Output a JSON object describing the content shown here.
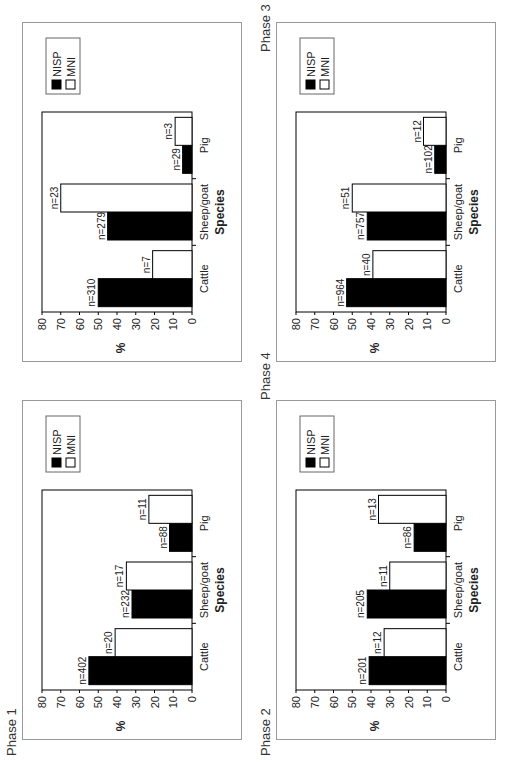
{
  "chart_data": [
    {
      "type": "bar",
      "title": "Phase 1",
      "xlabel": "Species",
      "ylabel": "%",
      "ylim": [
        0,
        80
      ],
      "yticks": [
        0,
        10,
        20,
        30,
        40,
        50,
        60,
        70,
        80
      ],
      "categories": [
        "Cattle",
        "Sheep/goat",
        "Pig"
      ],
      "legend": [
        "NISP",
        "MNI"
      ],
      "legend_position": "right",
      "grid": false,
      "series": [
        {
          "name": "NISP",
          "color": "#000000",
          "values": [
            55,
            32,
            12
          ],
          "labels": [
            "n=402",
            "n=232",
            "n=88"
          ]
        },
        {
          "name": "MNI",
          "color": "#ffffff",
          "values": [
            41,
            35,
            23
          ],
          "labels": [
            "n=20",
            "n=17",
            "n=11"
          ]
        }
      ]
    },
    {
      "type": "bar",
      "title": "Phase 2",
      "xlabel": "Species",
      "ylabel": "%",
      "ylim": [
        0,
        80
      ],
      "yticks": [
        0,
        10,
        20,
        30,
        40,
        50,
        60,
        70,
        80
      ],
      "categories": [
        "Cattle",
        "Sheep/goat",
        "Pig"
      ],
      "legend": [
        "NISP",
        "MNI"
      ],
      "legend_position": "right",
      "grid": false,
      "series": [
        {
          "name": "NISP",
          "color": "#000000",
          "values": [
            41,
            42,
            17
          ],
          "labels": [
            "n=201",
            "n=205",
            "n=86"
          ]
        },
        {
          "name": "MNI",
          "color": "#ffffff",
          "values": [
            33,
            30,
            36
          ],
          "labels": [
            "n=12",
            "n=11",
            "n=13"
          ]
        }
      ]
    },
    {
      "type": "bar",
      "title": "Phase 3",
      "xlabel": "Species",
      "ylabel": "%",
      "ylim": [
        0,
        80
      ],
      "yticks": [
        0,
        10,
        20,
        30,
        40,
        50,
        60,
        70,
        80
      ],
      "categories": [
        "Cattle",
        "Sheep/goat",
        "Pig"
      ],
      "legend": [
        "NISP",
        "MNI"
      ],
      "legend_position": "right",
      "grid": false,
      "series": [
        {
          "name": "NISP",
          "color": "#000000",
          "values": [
            53,
            42,
            6
          ],
          "labels": [
            "n=964",
            "n=757",
            "n=102"
          ]
        },
        {
          "name": "MNI",
          "color": "#ffffff",
          "values": [
            39,
            50,
            12
          ],
          "labels": [
            "n=40",
            "n=51",
            "n=12"
          ]
        }
      ]
    },
    {
      "type": "bar",
      "title": "Phase 4",
      "xlabel": "Species",
      "ylabel": "%",
      "ylim": [
        0,
        80
      ],
      "yticks": [
        0,
        10,
        20,
        30,
        40,
        50,
        60,
        70,
        80
      ],
      "categories": [
        "Cattle",
        "Sheep/goat",
        "Pig"
      ],
      "legend": [
        "NISP",
        "MNI"
      ],
      "legend_position": "right",
      "grid": false,
      "series": [
        {
          "name": "NISP",
          "color": "#000000",
          "values": [
            50,
            45,
            5
          ],
          "labels": [
            "n=310",
            "n=279",
            "n=29"
          ]
        },
        {
          "name": "MNI",
          "color": "#ffffff",
          "values": [
            21,
            70,
            9
          ],
          "labels": [
            "n=7",
            "n=23",
            "n=3"
          ]
        }
      ]
    }
  ],
  "phases": [
    {
      "label": "Phase 1"
    },
    {
      "label": "Phase 2"
    },
    {
      "label": "Phase 3"
    },
    {
      "label": "Phase 4"
    }
  ]
}
